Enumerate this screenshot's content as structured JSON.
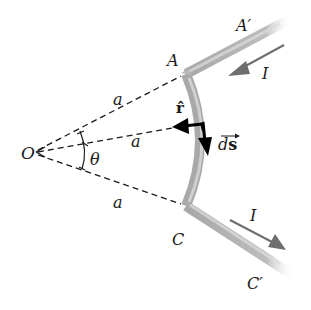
{
  "diagram": {
    "type": "physics-figure",
    "labels": {
      "origin": "O",
      "angle": "θ",
      "radius_upper": "a",
      "radius_middle": "a",
      "radius_lower": "a",
      "point_A": "A",
      "point_A_prime": "A′",
      "point_C": "C",
      "point_C_prime": "C′",
      "current_upper": "I",
      "current_lower": "I",
      "unit_vector_r": "r̂",
      "ds_d": "d",
      "ds_s": "s"
    },
    "colors": {
      "background": "#ffffff",
      "wire": "#b0b0b0",
      "wire_highlight": "#dcdcdc",
      "current_arrow": "#707070",
      "vector_arrow": "#000000",
      "dashed_line": "#1a1a1a",
      "text": "#1a1a1a"
    }
  }
}
